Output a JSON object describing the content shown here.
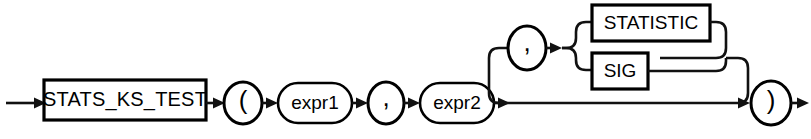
{
  "diagram": {
    "name": "stats_ks_test-syntax-diagram",
    "type": "railroad-syntax-diagram",
    "colors": {
      "background": "#ffffff",
      "stroke": "#000000",
      "text": "#000000"
    },
    "nodes": {
      "function_name": "STATS_KS_TEST",
      "open_paren": "(",
      "expr1": "expr1",
      "comma1": ",",
      "expr2": "expr2",
      "comma2": ",",
      "option_statistic": "STATISTIC",
      "option_sig": "SIG",
      "close_paren": ")"
    },
    "flow": {
      "entry_arrow": "→",
      "exit_arrow": "→",
      "optional_branch_label": "optional third argument",
      "choice_options": [
        "STATISTIC",
        "SIG"
      ]
    }
  }
}
